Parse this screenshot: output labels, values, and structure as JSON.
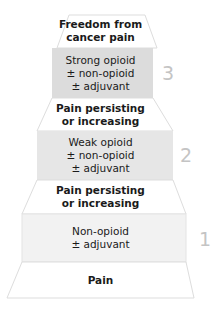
{
  "diagram": {
    "colors": {
      "step3_fill": "#dcdcdc",
      "step2_fill": "#e6e6e6",
      "step1_fill": "#f2f2f2",
      "outline": "#dddddd",
      "step_number": "#c4c4c4",
      "text": "#1a1a1a"
    },
    "top": {
      "line1": "Freedom from",
      "line2": "cancer pain"
    },
    "steps": [
      {
        "number": "3",
        "line1": "Strong opioid",
        "line2": "± non-opioid",
        "line3": "± adjuvant"
      },
      {
        "number": "2",
        "line1": "Weak opioid",
        "line2": "± non-opioid",
        "line3": "± adjuvant"
      },
      {
        "number": "1",
        "line1": "Non-opioid",
        "line2": "± adjuvant"
      }
    ],
    "transitions": [
      {
        "line1": "Pain persisting",
        "line2": "or increasing"
      },
      {
        "line1": "Pain persisting",
        "line2": "or increasing"
      }
    ],
    "bottom": {
      "label": "Pain"
    }
  }
}
